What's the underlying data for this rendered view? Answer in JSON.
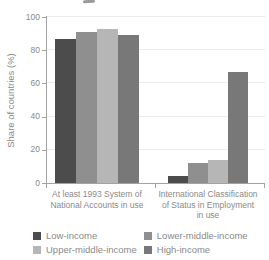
{
  "chart_data": {
    "type": "bar",
    "title": "",
    "ylabel": "Share of countries (%)",
    "xlabel": "",
    "ylim": [
      0,
      100
    ],
    "yticks": [
      0,
      20,
      40,
      60,
      80,
      100
    ],
    "grid": "horizontal",
    "legend_position": "bottom",
    "categories": [
      "At least 1993 System of\nNational Accounts in use",
      "International Classification\nof Status in Employment\nin use"
    ],
    "series": [
      {
        "name": "Low-income",
        "color": "#4c4c4c",
        "values": [
          87,
          4
        ]
      },
      {
        "name": "Lower-middle-income",
        "color": "#8f8f8f",
        "values": [
          91,
          12
        ]
      },
      {
        "name": "Upper-middle-income",
        "color": "#b6b6b6",
        "values": [
          93,
          14
        ]
      },
      {
        "name": "High-income",
        "color": "#787878",
        "values": [
          89,
          67
        ]
      }
    ]
  },
  "colors": {
    "text": "#8a8a8a",
    "axis": "#a3a3a3",
    "gridline": "#ebebeb",
    "background": "#ffffff"
  }
}
